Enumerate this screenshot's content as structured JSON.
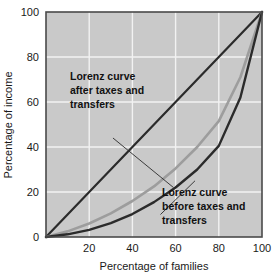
{
  "chart_data": {
    "type": "line",
    "title": "",
    "xlabel": "Percentage of families",
    "ylabel": "Percentage of income",
    "xlim": [
      0,
      100
    ],
    "ylim": [
      0,
      100
    ],
    "xticks": [
      "20",
      "40",
      "60",
      "80",
      "100"
    ],
    "xtick_values": [
      20,
      40,
      60,
      80,
      100
    ],
    "yticks": [
      "0",
      "20",
      "40",
      "60",
      "80",
      "100"
    ],
    "ytick_values": [
      0,
      20,
      40,
      60,
      80,
      100
    ],
    "grid": true,
    "legend_position": "none",
    "plot_background": "#c9c9c9",
    "grid_color": "#f2f2f2",
    "border_color": "#4a4a4a",
    "x": [
      0,
      10,
      20,
      30,
      40,
      50,
      60,
      70,
      80,
      90,
      100
    ],
    "series": [
      {
        "name": "Line of perfect equality",
        "color": "#2b2b2b",
        "width": 2.2,
        "values": [
          0,
          10,
          20,
          30,
          40,
          50,
          60,
          70,
          80,
          90,
          100
        ]
      },
      {
        "name": "Lorenz curve after taxes and transfers",
        "color": "#9d9d9d",
        "width": 2.6,
        "values": [
          0,
          2.5,
          6,
          10.5,
          16,
          22.5,
          30.5,
          40,
          51.5,
          71,
          100
        ]
      },
      {
        "name": "Lorenz curve before taxes and transfers",
        "color": "#2b2b2b",
        "width": 2.4,
        "values": [
          0,
          1.2,
          3.2,
          6.2,
          10.2,
          15.5,
          22,
          30,
          40.5,
          62,
          100
        ]
      }
    ],
    "annotations": [
      {
        "id": "after-taxes",
        "lines": [
          "Lorenz curve",
          "after taxes and",
          "transfers"
        ],
        "text": "Lorenz curve after taxes and transfers",
        "leader_from": [
          31,
          44
        ],
        "leader_to": [
          59,
          22
        ]
      },
      {
        "id": "before-taxes",
        "lines": [
          "Lorenz curve",
          "before taxes and",
          "transfers"
        ],
        "text": "Lorenz curve before taxes and transfers",
        "leader_from": [
          69,
          25
        ],
        "leader_to": [
          53,
          10
        ]
      }
    ]
  },
  "axis": {
    "x_title": "Percentage of families",
    "y_title": "Percentage of income"
  },
  "annotation_after": {
    "line1": "Lorenz curve",
    "line2": "after taxes and",
    "line3": "transfers"
  },
  "annotation_before": {
    "line1": "Lorenz curve",
    "line2": "before taxes and",
    "line3": "transfers"
  }
}
